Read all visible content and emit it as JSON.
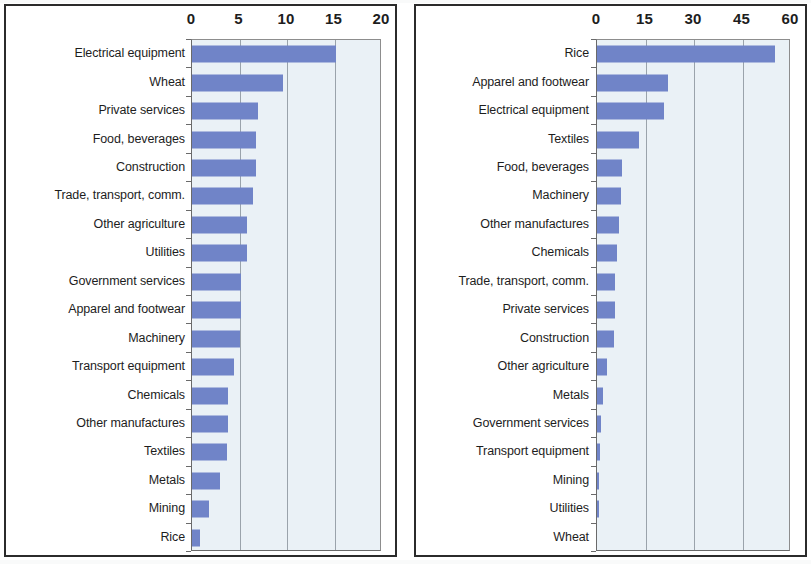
{
  "figure": {
    "bar_color": "#7084c8",
    "plot_background": "#eaf1f6",
    "gridline_color": "#9aa3ab",
    "frame_color": "#2b2b2b"
  },
  "chart_data": [
    {
      "panel": "left",
      "type": "bar",
      "orientation": "horizontal",
      "title": "",
      "xlabel": "",
      "ylabel": "",
      "xlim": [
        0,
        20
      ],
      "xticks": [
        0,
        5,
        10,
        15,
        20
      ],
      "grid": true,
      "legend": "none",
      "categories": [
        "Electrical equipment",
        "Wheat",
        "Private services",
        "Food, beverages",
        "Construction",
        "Trade, transport, comm.",
        "Other agriculture",
        "Utilities",
        "Government services",
        "Apparel and footwear",
        "Machinery",
        "Transport equipment",
        "Chemicals",
        "Other manufactures",
        "Textiles",
        "Metals",
        "Mining",
        "Rice"
      ],
      "values": [
        15.2,
        9.6,
        6.9,
        6.7,
        6.7,
        6.4,
        5.8,
        5.8,
        5.2,
        5.2,
        5.0,
        4.4,
        3.8,
        3.8,
        3.7,
        2.9,
        1.8,
        0.8
      ]
    },
    {
      "panel": "right",
      "type": "bar",
      "orientation": "horizontal",
      "title": "",
      "xlabel": "",
      "ylabel": "",
      "xlim": [
        0,
        60
      ],
      "xticks": [
        0,
        15,
        30,
        45,
        60
      ],
      "grid": true,
      "legend": "none",
      "categories": [
        "Rice",
        "Apparel and footwear",
        "Electrical equipment",
        "Textiles",
        "Food, beverages",
        "Machinery",
        "Other manufactures",
        "Chemicals",
        "Trade, transport, comm.",
        "Private services",
        "Construction",
        "Other agriculture",
        "Metals",
        "Government services",
        "Transport equipment",
        "Mining",
        "Utilities",
        "Wheat"
      ],
      "values": [
        55.2,
        21.9,
        20.6,
        13.0,
        7.6,
        7.3,
        6.7,
        6.3,
        5.7,
        5.6,
        5.4,
        3.2,
        1.9,
        1.3,
        0.8,
        0.6,
        0.5,
        0.0
      ]
    }
  ]
}
